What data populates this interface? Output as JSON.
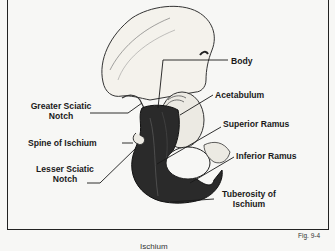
{
  "figure": {
    "number": "Fig. 9-4",
    "caption": "Ischium",
    "colors": {
      "background": "#f7f7f5",
      "frame": "#222222",
      "bone_light": "#f4f2ec",
      "ischium_dark": "#2a2a2a",
      "text": "#1a1a1a"
    }
  },
  "labels": {
    "body": "Body",
    "acetabulum": "Acetabulum",
    "greater_sciatic_notch_1": "Greater Sciatic",
    "greater_sciatic_notch_2": "Notch",
    "superior_ramus": "Superior Ramus",
    "spine_of_ischium": "Spine of Ischium",
    "inferior_ramus": "Inferior Ramus",
    "lesser_sciatic_notch_1": "Lesser Sciatic",
    "lesser_sciatic_notch_2": "Notch",
    "tuberosity_1": "Tuberosity of",
    "tuberosity_2": "Ischium"
  }
}
